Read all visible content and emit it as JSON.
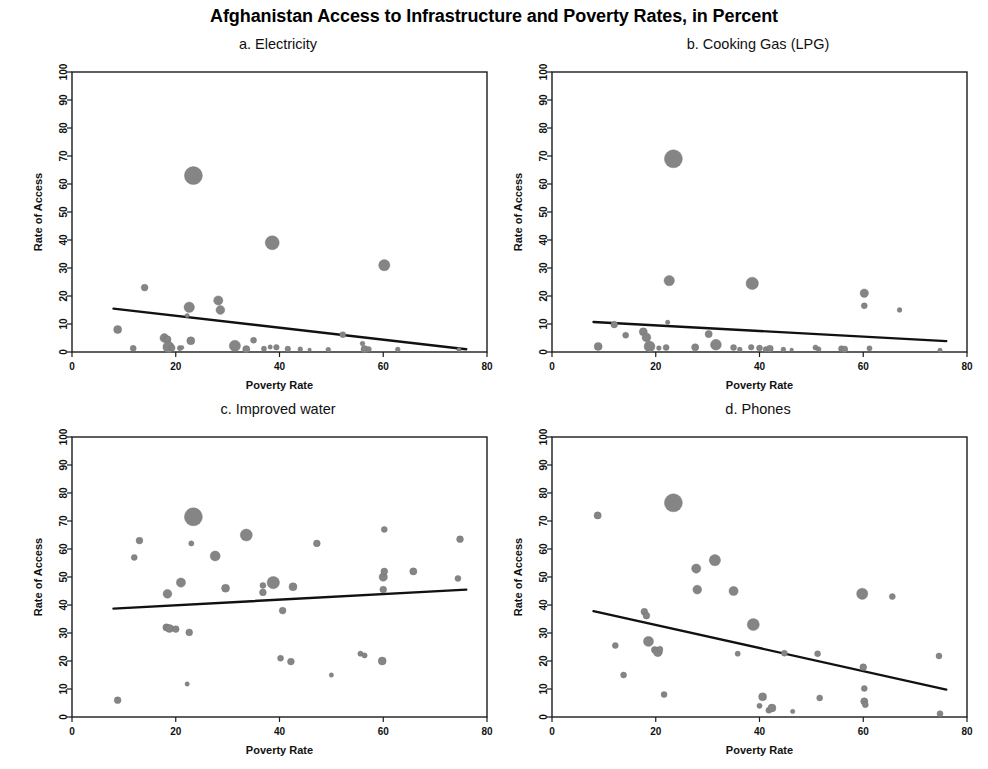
{
  "figure": {
    "title": "Afghanistan Access to Infrastructure and Poverty Rates, in Percent",
    "background": "#ffffff",
    "point_color": "#858585",
    "line_color": "#111111"
  },
  "panels": [
    {
      "id": "a",
      "title": "a. Electricity"
    },
    {
      "id": "b",
      "title": "b. Cooking Gas (LPG)"
    },
    {
      "id": "c",
      "title": "c. Improved water"
    },
    {
      "id": "d",
      "title": "d. Phones"
    }
  ],
  "axes": {
    "xlabel": "Poverty Rate",
    "ylabel": "Rate of Access",
    "xticks": [
      "0",
      "20",
      "40",
      "60",
      "80"
    ],
    "yticks": [
      "0",
      "10",
      "20",
      "30",
      "40",
      "50",
      "60",
      "70",
      "80",
      "90",
      "100"
    ]
  },
  "chart_data": [
    {
      "type": "scatter",
      "panel": "a",
      "title": "a. Electricity",
      "xlabel": "Poverty Rate",
      "ylabel": "Rate of Access",
      "xlim": [
        0,
        80
      ],
      "ylim": [
        0,
        100
      ],
      "xticks": [
        0,
        20,
        40,
        60,
        80
      ],
      "yticks": [
        0,
        10,
        20,
        30,
        40,
        50,
        60,
        70,
        80,
        90,
        100
      ],
      "grid": false,
      "legend": "none",
      "bubble_encoding": "marker size proportional to province population weight",
      "points": [
        {
          "x": 8.8,
          "y": 8.0,
          "s": 4.0
        },
        {
          "x": 11.8,
          "y": 1.3,
          "s": 3.0
        },
        {
          "x": 14.0,
          "y": 23.0,
          "s": 3.4
        },
        {
          "x": 17.8,
          "y": 5.0,
          "s": 4.4
        },
        {
          "x": 18.4,
          "y": 4.5,
          "s": 3.6
        },
        {
          "x": 18.6,
          "y": 1.8,
          "s": 5.6
        },
        {
          "x": 19.3,
          "y": 1.4,
          "s": 3.0
        },
        {
          "x": 20.8,
          "y": 1.4,
          "s": 2.6
        },
        {
          "x": 21.2,
          "y": 1.6,
          "s": 2.0
        },
        {
          "x": 22.6,
          "y": 16.0,
          "s": 5.2
        },
        {
          "x": 22.2,
          "y": 13.0,
          "s": 2.2
        },
        {
          "x": 23.4,
          "y": 63.0,
          "s": 9.0
        },
        {
          "x": 22.9,
          "y": 4.0,
          "s": 4.0
        },
        {
          "x": 28.2,
          "y": 18.4,
          "s": 4.6
        },
        {
          "x": 28.6,
          "y": 15.0,
          "s": 4.4
        },
        {
          "x": 31.4,
          "y": 2.2,
          "s": 5.6
        },
        {
          "x": 33.6,
          "y": 1.0,
          "s": 3.6
        },
        {
          "x": 35.0,
          "y": 4.2,
          "s": 3.0
        },
        {
          "x": 37.0,
          "y": 1.2,
          "s": 2.6
        },
        {
          "x": 38.6,
          "y": 39.0,
          "s": 7.0
        },
        {
          "x": 38.2,
          "y": 1.8,
          "s": 2.2
        },
        {
          "x": 39.4,
          "y": 1.7,
          "s": 2.8
        },
        {
          "x": 41.6,
          "y": 1.1,
          "s": 2.8
        },
        {
          "x": 44.0,
          "y": 1.0,
          "s": 2.4
        },
        {
          "x": 45.8,
          "y": 0.8,
          "s": 1.8
        },
        {
          "x": 49.4,
          "y": 0.8,
          "s": 2.4
        },
        {
          "x": 52.2,
          "y": 6.2,
          "s": 3.0
        },
        {
          "x": 56.0,
          "y": 3.0,
          "s": 2.4
        },
        {
          "x": 56.4,
          "y": 1.0,
          "s": 3.6
        },
        {
          "x": 57.2,
          "y": 1.0,
          "s": 2.6
        },
        {
          "x": 60.2,
          "y": 31.0,
          "s": 5.6
        },
        {
          "x": 62.8,
          "y": 0.9,
          "s": 2.4
        },
        {
          "x": 74.6,
          "y": 0.8,
          "s": 2.2
        }
      ],
      "fit_line": {
        "x0": 8.0,
        "y0": 15.5,
        "x1": 76.0,
        "y1": 1.0,
        "slope": -0.213,
        "intercept": 17.2
      }
    },
    {
      "type": "scatter",
      "panel": "b",
      "title": "b. Cooking Gas (LPG)",
      "xlabel": "Poverty Rate",
      "ylabel": "Rate of Access",
      "xlim": [
        0,
        80
      ],
      "ylim": [
        0,
        100
      ],
      "xticks": [
        0,
        20,
        40,
        60,
        80
      ],
      "yticks": [
        0,
        10,
        20,
        30,
        40,
        50,
        60,
        70,
        80,
        90,
        100
      ],
      "grid": false,
      "legend": "none",
      "bubble_encoding": "marker size proportional to province population weight",
      "points": [
        {
          "x": 8.9,
          "y": 2.0,
          "s": 4.0
        },
        {
          "x": 12.0,
          "y": 9.8,
          "s": 3.4
        },
        {
          "x": 14.2,
          "y": 6.0,
          "s": 3.0
        },
        {
          "x": 17.6,
          "y": 7.2,
          "s": 4.0
        },
        {
          "x": 18.2,
          "y": 5.2,
          "s": 4.4
        },
        {
          "x": 18.8,
          "y": 2.0,
          "s": 5.4
        },
        {
          "x": 20.6,
          "y": 1.4,
          "s": 2.4
        },
        {
          "x": 22.0,
          "y": 1.6,
          "s": 3.0
        },
        {
          "x": 22.6,
          "y": 25.5,
          "s": 5.2
        },
        {
          "x": 22.3,
          "y": 10.6,
          "s": 2.2
        },
        {
          "x": 23.4,
          "y": 69.0,
          "s": 9.0
        },
        {
          "x": 27.6,
          "y": 1.7,
          "s": 3.6
        },
        {
          "x": 30.2,
          "y": 6.4,
          "s": 3.6
        },
        {
          "x": 31.6,
          "y": 2.6,
          "s": 5.4
        },
        {
          "x": 35.0,
          "y": 1.6,
          "s": 3.0
        },
        {
          "x": 36.2,
          "y": 0.9,
          "s": 2.4
        },
        {
          "x": 38.6,
          "y": 24.5,
          "s": 6.2
        },
        {
          "x": 38.4,
          "y": 1.7,
          "s": 2.8
        },
        {
          "x": 40.0,
          "y": 1.4,
          "s": 3.0
        },
        {
          "x": 41.2,
          "y": 1.0,
          "s": 2.6
        },
        {
          "x": 42.0,
          "y": 1.2,
          "s": 3.4
        },
        {
          "x": 44.6,
          "y": 0.9,
          "s": 2.4
        },
        {
          "x": 46.2,
          "y": 0.8,
          "s": 1.8
        },
        {
          "x": 50.8,
          "y": 1.6,
          "s": 2.6
        },
        {
          "x": 51.4,
          "y": 1.0,
          "s": 2.4
        },
        {
          "x": 55.8,
          "y": 1.2,
          "s": 3.0
        },
        {
          "x": 56.4,
          "y": 1.0,
          "s": 3.2
        },
        {
          "x": 60.2,
          "y": 21.0,
          "s": 4.2
        },
        {
          "x": 60.2,
          "y": 16.5,
          "s": 3.0
        },
        {
          "x": 61.2,
          "y": 1.3,
          "s": 2.6
        },
        {
          "x": 67.0,
          "y": 15.0,
          "s": 2.4
        },
        {
          "x": 74.8,
          "y": 0.6,
          "s": 2.2
        }
      ],
      "fit_line": {
        "x0": 8.0,
        "y0": 10.7,
        "x1": 76.0,
        "y1": 3.9,
        "slope": -0.1,
        "intercept": 11.5
      }
    },
    {
      "type": "scatter",
      "panel": "c",
      "title": "c. Improved water",
      "xlabel": "Poverty Rate",
      "ylabel": "Rate of Access",
      "xlim": [
        0,
        80
      ],
      "ylim": [
        0,
        100
      ],
      "xticks": [
        0,
        20,
        40,
        60,
        80
      ],
      "yticks": [
        0,
        10,
        20,
        30,
        40,
        50,
        60,
        70,
        80,
        90,
        100
      ],
      "grid": false,
      "legend": "none",
      "bubble_encoding": "marker size proportional to province population weight",
      "points": [
        {
          "x": 8.8,
          "y": 6.0,
          "s": 3.4
        },
        {
          "x": 12.0,
          "y": 57.0,
          "s": 3.0
        },
        {
          "x": 13.0,
          "y": 63.0,
          "s": 3.4
        },
        {
          "x": 18.4,
          "y": 44.0,
          "s": 4.4
        },
        {
          "x": 18.2,
          "y": 32.0,
          "s": 3.6
        },
        {
          "x": 18.8,
          "y": 31.6,
          "s": 4.0
        },
        {
          "x": 20.0,
          "y": 31.4,
          "s": 3.4
        },
        {
          "x": 21.0,
          "y": 48.0,
          "s": 4.6
        },
        {
          "x": 22.2,
          "y": 11.8,
          "s": 2.2
        },
        {
          "x": 22.6,
          "y": 30.2,
          "s": 3.4
        },
        {
          "x": 23.4,
          "y": 71.5,
          "s": 9.0
        },
        {
          "x": 23.0,
          "y": 62.0,
          "s": 2.6
        },
        {
          "x": 27.6,
          "y": 57.5,
          "s": 5.0
        },
        {
          "x": 29.6,
          "y": 46.0,
          "s": 4.0
        },
        {
          "x": 33.6,
          "y": 65.0,
          "s": 6.0
        },
        {
          "x": 36.8,
          "y": 44.5,
          "s": 3.4
        },
        {
          "x": 36.8,
          "y": 47.0,
          "s": 3.0
        },
        {
          "x": 38.8,
          "y": 48.0,
          "s": 6.2
        },
        {
          "x": 40.6,
          "y": 38.0,
          "s": 3.4
        },
        {
          "x": 40.2,
          "y": 21.0,
          "s": 3.0
        },
        {
          "x": 42.2,
          "y": 19.8,
          "s": 3.4
        },
        {
          "x": 42.6,
          "y": 46.5,
          "s": 4.0
        },
        {
          "x": 47.2,
          "y": 62.0,
          "s": 3.4
        },
        {
          "x": 50.0,
          "y": 15.0,
          "s": 2.2
        },
        {
          "x": 55.6,
          "y": 22.6,
          "s": 2.6
        },
        {
          "x": 56.4,
          "y": 22.0,
          "s": 2.6
        },
        {
          "x": 59.8,
          "y": 20.0,
          "s": 4.0
        },
        {
          "x": 60.2,
          "y": 67.0,
          "s": 3.0
        },
        {
          "x": 60.0,
          "y": 50.0,
          "s": 4.2
        },
        {
          "x": 60.2,
          "y": 52.0,
          "s": 3.4
        },
        {
          "x": 60.0,
          "y": 45.5,
          "s": 3.4
        },
        {
          "x": 65.8,
          "y": 52.0,
          "s": 3.6
        },
        {
          "x": 74.8,
          "y": 63.5,
          "s": 3.4
        },
        {
          "x": 74.4,
          "y": 49.5,
          "s": 3.0
        }
      ],
      "fit_line": {
        "x0": 8.0,
        "y0": 38.7,
        "x1": 76.0,
        "y1": 45.5,
        "slope": 0.1,
        "intercept": 37.9
      }
    },
    {
      "type": "scatter",
      "panel": "d",
      "title": "d. Phones",
      "xlabel": "Poverty Rate",
      "ylabel": "Rate of Access",
      "xlim": [
        0,
        80
      ],
      "ylim": [
        0,
        100
      ],
      "xticks": [
        0,
        20,
        40,
        60,
        80
      ],
      "yticks": [
        0,
        10,
        20,
        30,
        40,
        50,
        60,
        70,
        80,
        90,
        100
      ],
      "grid": false,
      "legend": "none",
      "bubble_encoding": "marker size proportional to province population weight",
      "points": [
        {
          "x": 8.8,
          "y": 72.0,
          "s": 3.6
        },
        {
          "x": 12.2,
          "y": 25.5,
          "s": 3.0
        },
        {
          "x": 13.8,
          "y": 15.0,
          "s": 3.0
        },
        {
          "x": 17.8,
          "y": 37.6,
          "s": 3.4
        },
        {
          "x": 18.2,
          "y": 36.2,
          "s": 3.4
        },
        {
          "x": 18.6,
          "y": 27.0,
          "s": 5.0
        },
        {
          "x": 19.8,
          "y": 24.0,
          "s": 3.4
        },
        {
          "x": 20.4,
          "y": 23.2,
          "s": 4.6
        },
        {
          "x": 20.8,
          "y": 24.2,
          "s": 3.0
        },
        {
          "x": 21.6,
          "y": 8.0,
          "s": 3.0
        },
        {
          "x": 23.4,
          "y": 76.5,
          "s": 9.0
        },
        {
          "x": 27.8,
          "y": 53.0,
          "s": 4.6
        },
        {
          "x": 28.0,
          "y": 45.5,
          "s": 4.4
        },
        {
          "x": 31.4,
          "y": 56.0,
          "s": 5.6
        },
        {
          "x": 35.0,
          "y": 45.0,
          "s": 4.6
        },
        {
          "x": 35.8,
          "y": 22.6,
          "s": 2.6
        },
        {
          "x": 38.8,
          "y": 33.0,
          "s": 6.0
        },
        {
          "x": 40.6,
          "y": 7.2,
          "s": 4.0
        },
        {
          "x": 40.0,
          "y": 4.0,
          "s": 2.6
        },
        {
          "x": 41.8,
          "y": 2.4,
          "s": 3.0
        },
        {
          "x": 42.4,
          "y": 3.2,
          "s": 4.0
        },
        {
          "x": 44.8,
          "y": 22.8,
          "s": 3.0
        },
        {
          "x": 46.4,
          "y": 2.0,
          "s": 2.2
        },
        {
          "x": 51.2,
          "y": 22.6,
          "s": 3.0
        },
        {
          "x": 51.6,
          "y": 6.8,
          "s": 3.0
        },
        {
          "x": 59.8,
          "y": 44.0,
          "s": 5.6
        },
        {
          "x": 60.0,
          "y": 17.8,
          "s": 3.4
        },
        {
          "x": 60.2,
          "y": 10.2,
          "s": 3.0
        },
        {
          "x": 60.2,
          "y": 5.6,
          "s": 3.6
        },
        {
          "x": 60.4,
          "y": 4.4,
          "s": 3.0
        },
        {
          "x": 65.6,
          "y": 43.0,
          "s": 3.0
        },
        {
          "x": 74.6,
          "y": 21.8,
          "s": 3.0
        },
        {
          "x": 74.8,
          "y": 1.2,
          "s": 3.0
        }
      ],
      "fit_line": {
        "x0": 8.0,
        "y0": 37.8,
        "x1": 76.0,
        "y1": 9.8,
        "slope": -0.412,
        "intercept": 41.1
      }
    }
  ]
}
